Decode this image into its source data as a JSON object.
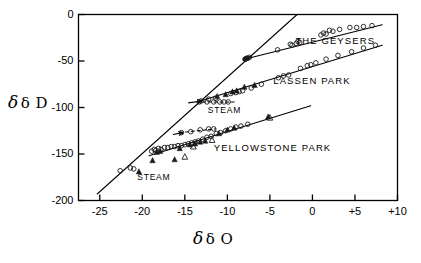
{
  "chart_data": {
    "type": "scatter",
    "title": "",
    "xlabel": "δ O",
    "ylabel": "δ D",
    "xlim": [
      -27.5,
      10
    ],
    "ylim": [
      -200,
      0
    ],
    "grid": false,
    "legend_position": "inline-annotations",
    "xticks": [
      -25,
      -20,
      -15,
      -10,
      -5,
      0,
      5,
      10
    ],
    "xtick_labels": [
      "-25",
      "-20",
      "-15",
      "-10",
      "-5",
      "0",
      "+5",
      "+10"
    ],
    "yticks": [
      0,
      -50,
      -100,
      -150,
      -200
    ],
    "ytick_labels": [
      "0",
      "-50",
      "-100",
      "-150",
      "-200"
    ],
    "annotations": [
      {
        "text": "THE GEYSERS",
        "x": -2.0,
        "y": -29
      },
      {
        "text": "LASSEN PARK",
        "x": -4.6,
        "y": -72
      },
      {
        "text": "YELLOWSTONE PARK",
        "x": -11.6,
        "y": -144
      },
      {
        "text": "STEAM",
        "x": -12.3,
        "y": -104
      },
      {
        "text": "STEAM",
        "x": -20.6,
        "y": -176
      }
    ],
    "lines": [
      {
        "name": "meteoric-water-line",
        "style": "solid",
        "x": [
          -25.3,
          -1.8
        ],
        "y": [
          -193,
          0
        ]
      },
      {
        "name": "the-geysers-trend",
        "style": "solid",
        "x": [
          -8.0,
          8.2
        ],
        "y": [
          -48,
          -11
        ]
      },
      {
        "name": "lassen-park-trend",
        "style": "solid",
        "x": [
          -13.2,
          8.2
        ],
        "y": [
          -93,
          -33
        ]
      },
      {
        "name": "yellowstone-park-trend",
        "style": "solid",
        "x": [
          -19.2,
          -0.2
        ],
        "y": [
          -152,
          -98
        ]
      },
      {
        "name": "geysers-steam-dashed",
        "style": "dashed",
        "x": [
          -13.6,
          -9.2
        ],
        "y": [
          -94,
          -94
        ]
      },
      {
        "name": "yellowstone-steam-dashed",
        "style": "dashed",
        "x": [
          -15.6,
          -11.4
        ],
        "y": [
          -127,
          -123
        ]
      }
    ],
    "arrows": [
      {
        "name": "geysers-steam-arrow",
        "x_tail": -14.6,
        "y_tail": -95,
        "x_head": -13.0,
        "y_head": -93
      },
      {
        "name": "yellowstone-steam-arrow",
        "x_tail": -16.4,
        "y_tail": -129,
        "x_head": -15.2,
        "y_head": -127
      }
    ],
    "series": [
      {
        "name": "The Geysers",
        "marker": "open-circle",
        "points": [
          [
            -7.9,
            -48
          ],
          [
            -7.6,
            -47
          ],
          [
            -7.4,
            -46
          ],
          [
            -4.1,
            -38
          ],
          [
            -2.6,
            -32
          ],
          [
            -2.4,
            -33
          ],
          [
            -1.9,
            -31
          ],
          [
            -1.7,
            -29
          ],
          [
            -1.5,
            -30
          ],
          [
            1.0,
            -22
          ],
          [
            1.3,
            -20
          ],
          [
            1.6,
            -21
          ],
          [
            2.0,
            -17
          ],
          [
            2.4,
            -18
          ],
          [
            3.2,
            -16
          ],
          [
            4.4,
            -14
          ],
          [
            5.2,
            -14
          ],
          [
            6.0,
            -13
          ],
          [
            7.0,
            -12
          ]
        ]
      },
      {
        "name": "The Geysers steam",
        "marker": "open-circle",
        "points": [
          [
            -13.3,
            -94
          ],
          [
            -12.4,
            -94
          ],
          [
            -11.6,
            -94
          ],
          [
            -10.9,
            -94
          ],
          [
            -10.4,
            -94
          ],
          [
            -9.9,
            -94
          ]
        ]
      },
      {
        "name": "Lassen Park",
        "marker": "open-circle",
        "points": [
          [
            -13.1,
            -93
          ],
          [
            -12.2,
            -91
          ],
          [
            -11.4,
            -90
          ],
          [
            -9.6,
            -85
          ],
          [
            -9.0,
            -84
          ],
          [
            -8.6,
            -83
          ],
          [
            -8.2,
            -82
          ],
          [
            -7.2,
            -79
          ],
          [
            -6.0,
            -75
          ],
          [
            -4.0,
            -68
          ],
          [
            -3.4,
            -66
          ],
          [
            -2.8,
            -65
          ],
          [
            -1.4,
            -58
          ],
          [
            -0.6,
            -55
          ],
          [
            -0.2,
            -54
          ],
          [
            0.4,
            -52
          ],
          [
            1.6,
            -48
          ],
          [
            3.0,
            -44
          ],
          [
            4.6,
            -40
          ],
          [
            6.0,
            -36
          ],
          [
            7.4,
            -33
          ]
        ]
      },
      {
        "name": "Lassen Park (filled triangles)",
        "marker": "filled-triangle",
        "points": [
          [
            -11.2,
            -88
          ],
          [
            -10.2,
            -86
          ],
          [
            -9.4,
            -83
          ],
          [
            -8.9,
            -82
          ],
          [
            -8.0,
            -78
          ],
          [
            -6.8,
            -76
          ]
        ]
      },
      {
        "name": "Yellowstone Park",
        "marker": "open-circle",
        "points": [
          [
            -22.6,
            -168
          ],
          [
            -21.4,
            -165
          ],
          [
            -21.0,
            -166
          ],
          [
            -18.9,
            -147
          ],
          [
            -18.6,
            -145
          ],
          [
            -18.4,
            -146
          ],
          [
            -18.1,
            -144
          ],
          [
            -17.8,
            -145
          ],
          [
            -17.4,
            -143
          ],
          [
            -17.0,
            -143
          ],
          [
            -16.6,
            -142
          ],
          [
            -16.2,
            -142
          ],
          [
            -15.8,
            -141
          ],
          [
            -15.4,
            -141
          ],
          [
            -15.0,
            -140
          ],
          [
            -14.6,
            -139
          ],
          [
            -14.2,
            -138
          ],
          [
            -13.8,
            -137
          ],
          [
            -13.4,
            -136
          ],
          [
            -12.9,
            -134
          ],
          [
            -12.4,
            -132
          ],
          [
            -11.9,
            -131
          ],
          [
            -11.3,
            -128
          ],
          [
            -10.8,
            -127
          ],
          [
            -10.2,
            -125
          ],
          [
            -9.6,
            -123
          ],
          [
            -9.0,
            -121
          ],
          [
            -8.4,
            -120
          ],
          [
            -7.6,
            -118
          ]
        ]
      },
      {
        "name": "Yellowstone Park (filled triangles)",
        "marker": "filled-triangle",
        "points": [
          [
            -20.4,
            -169
          ],
          [
            -18.8,
            -157
          ],
          [
            -18.3,
            -148
          ],
          [
            -17.9,
            -147
          ],
          [
            -16.2,
            -156
          ],
          [
            -15.6,
            -144
          ],
          [
            -14.4,
            -140
          ],
          [
            -13.8,
            -139
          ],
          [
            -13.2,
            -137
          ],
          [
            -12.6,
            -136
          ],
          [
            -11.0,
            -128
          ],
          [
            -10.0,
            -124
          ],
          [
            -9.2,
            -122
          ],
          [
            -5.2,
            -110
          ]
        ]
      },
      {
        "name": "Yellowstone Park (open triangles)",
        "marker": "open-triangle",
        "points": [
          [
            -15.0,
            -153
          ],
          [
            -14.0,
            -142
          ],
          [
            -11.8,
            -135
          ],
          [
            -5.0,
            -111
          ]
        ]
      },
      {
        "name": "Yellowstone steam",
        "marker": "open-circle",
        "points": [
          [
            -15.4,
            -127
          ],
          [
            -14.3,
            -126
          ],
          [
            -13.2,
            -124
          ],
          [
            -12.2,
            -123
          ],
          [
            -11.6,
            -123
          ]
        ]
      },
      {
        "name": "Meteoric line cluster",
        "marker": "filled-circle",
        "points": [
          [
            -7.9,
            -48
          ],
          [
            -7.7,
            -47
          ]
        ]
      }
    ]
  },
  "figure": {
    "background_color": "#ffffff",
    "axis_color": "#000000",
    "marker_color": "#1a1a1a"
  }
}
